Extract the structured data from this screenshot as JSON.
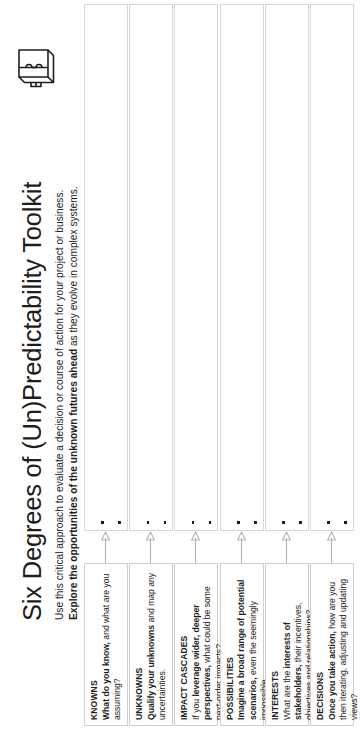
{
  "header": {
    "title": "Six Degrees of (Un)Predictability Toolkit",
    "subtitle_line1": "Use this critical approach to evaluate a decision or course of action for your project or business.",
    "subtitle_line2_bold": "Explore the opportunities of the unknown futures ahead",
    "subtitle_line2_rest": " as they evolve in complex systems.",
    "logo_icon": "3d-box-icon"
  },
  "sections": [
    {
      "id": "knowns",
      "heading": "KNOWNS",
      "prompt_bold": "What do you know,",
      "prompt_rest": " and what are you assuming?",
      "arrow_icon": "arrow-right-icon",
      "bullet_count": 2,
      "bullet_marker": "square-bullet"
    },
    {
      "id": "unknowns",
      "heading": "UNKNOWNS",
      "prompt_bold": "Qualify your unknowns",
      "prompt_rest": " and map any uncertainties.",
      "arrow_icon": "arrow-right-icon",
      "bullet_count": 2,
      "bullet_marker": "square-bullet"
    },
    {
      "id": "impact-cascades",
      "heading": "IMPACT CASCADES",
      "prompt_pre": "If you ",
      "prompt_bold": "leverage wider, deeper perspectives,",
      "prompt_rest": " what could be some next-order impacts?",
      "arrow_icon": "arrow-right-icon",
      "bullet_count": 2,
      "bullet_marker": "square-bullet"
    },
    {
      "id": "possibilities",
      "heading": "POSSIBILITIES",
      "prompt_bold": "Imagine a broad range of potential scenarios,",
      "prompt_rest": " even the seemingly impossible.",
      "arrow_icon": "arrow-right-icon",
      "bullet_count": 2,
      "bullet_marker": "square-bullet"
    },
    {
      "id": "interests",
      "heading": "INTERESTS",
      "prompt_pre": "What are the ",
      "prompt_bold": "interests of stakeholders,",
      "prompt_rest": " their incentives, objectives and relationships?",
      "arrow_icon": "arrow-right-icon",
      "bullet_count": 2,
      "bullet_marker": "square-bullet"
    },
    {
      "id": "decisions",
      "heading": "DECISIONS",
      "prompt_bold": "Once you take action,",
      "prompt_rest": " how are you then iterating, adjusting and updating views?",
      "arrow_icon": "arrow-right-icon",
      "bullet_count": 2,
      "bullet_marker": "square-bullet"
    }
  ],
  "colors": {
    "text": "#1d1d1b",
    "box_border": "#cfcfcf",
    "answer_border": "#d7d7d7",
    "arrow": "#b3b3b3",
    "background": "#ffffff"
  }
}
